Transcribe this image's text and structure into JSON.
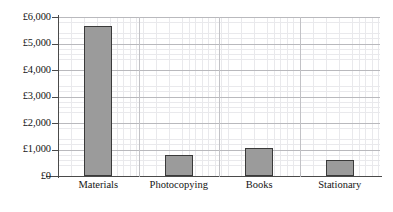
{
  "chart_data": {
    "type": "bar",
    "title": "",
    "xlabel": "",
    "ylabel": "",
    "categories": [
      "Materials",
      "Photocopying",
      "Books",
      "Stationary"
    ],
    "values": [
      5650,
      800,
      1050,
      600
    ],
    "ylim": [
      0,
      6000
    ],
    "ytick_values": [
      0,
      1000,
      2000,
      3000,
      4000,
      5000,
      6000
    ],
    "ytick_labels": [
      "£0",
      "£1,000",
      "£2,000",
      "£3,000",
      "£4,000",
      "£5,000",
      "£6,000"
    ],
    "currency_symbol": "£",
    "grid": {
      "major_horizontal": true,
      "major_vertical": true,
      "minor": true,
      "minor_x_spacing_px": 6.54,
      "minor_y_spacing_px": 5.3
    },
    "legend": {
      "visible": false,
      "position": "none"
    },
    "colors": {
      "bar_fill": "#9b9b9b",
      "bar_border": "#3a3a3a",
      "axis": "#4a4a4a",
      "major_grid": "#b9b9bd",
      "minor_grid": "#e9e9ec",
      "text": "#141414",
      "background": "#ffffff"
    },
    "series": [
      {
        "name": "Expenditure",
        "values": [
          5650,
          800,
          1050,
          600
        ]
      }
    ]
  }
}
